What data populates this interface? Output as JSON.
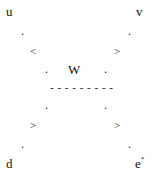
{
  "diagram": {
    "corners": {
      "top_left": "u",
      "top_right": "v",
      "bottom_left": "d",
      "bottom_right_base": "e",
      "bottom_right_sup": "*"
    },
    "center_label": "W",
    "dot": ".",
    "arrows": {
      "upper_left": "<",
      "upper_right": ">",
      "lower_left": ">",
      "lower_right": ">"
    },
    "separator": "- - - - - - - - -"
  }
}
